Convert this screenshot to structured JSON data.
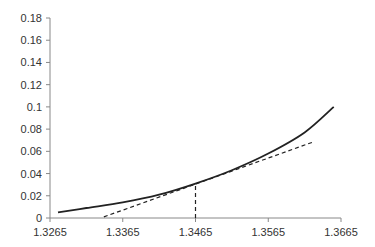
{
  "chart_data": {
    "type": "line",
    "title": "",
    "xlabel": "",
    "ylabel": "",
    "xlim": [
      1.3265,
      1.3665
    ],
    "ylim": [
      0,
      0.18
    ],
    "grid": false,
    "legend": null,
    "x_ticks": [
      "1.3265",
      "1.3365",
      "1.3465",
      "1.3565",
      "1.3665"
    ],
    "y_ticks": [
      "0",
      "0.02",
      "0.04",
      "0.06",
      "0.08",
      "0.1",
      "0.12",
      "0.14",
      "0.16",
      "0.18"
    ],
    "series": [
      {
        "name": "curve",
        "style": "solid",
        "color": "#222222",
        "x": [
          1.3276,
          1.3315,
          1.3365,
          1.3415,
          1.3465,
          1.3515,
          1.3565,
          1.3615,
          1.3655
        ],
        "y": [
          0.005,
          0.009,
          0.014,
          0.021,
          0.031,
          0.043,
          0.058,
          0.077,
          0.1
        ]
      },
      {
        "name": "tangent",
        "style": "dashed",
        "color": "#222222",
        "x": [
          1.3339,
          1.3625
        ],
        "y": [
          0.001,
          0.068
        ]
      },
      {
        "name": "vertical-marker",
        "style": "dashed",
        "color": "#222222",
        "x": [
          1.3465,
          1.3465
        ],
        "y": [
          0,
          0.031
        ]
      }
    ]
  }
}
